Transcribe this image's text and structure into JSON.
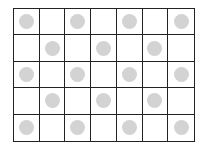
{
  "grid": {
    "rows": 5,
    "cols": 7,
    "line_color": "#222222",
    "dot_color": "#d3d3d3",
    "cells": [
      [
        1,
        0,
        1,
        0,
        1,
        0,
        1
      ],
      [
        0,
        1,
        0,
        1,
        0,
        1,
        0
      ],
      [
        1,
        0,
        1,
        0,
        1,
        0,
        1
      ],
      [
        0,
        1,
        0,
        1,
        0,
        1,
        0
      ],
      [
        1,
        0,
        1,
        0,
        1,
        0,
        1
      ]
    ]
  }
}
